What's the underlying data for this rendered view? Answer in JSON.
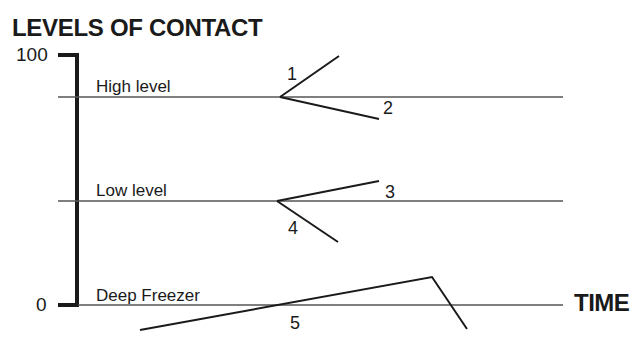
{
  "title": "LEVELS OF CONTACT",
  "axis": {
    "y_top_label": "100",
    "y_bottom_label": "0",
    "x_label": "TIME"
  },
  "levels": [
    {
      "label": "High level"
    },
    {
      "label": "Low level"
    },
    {
      "label": "Deep Freezer"
    }
  ],
  "paths": [
    {
      "id": "1",
      "description": "from high level rising upward"
    },
    {
      "id": "2",
      "description": "from high level declining slightly"
    },
    {
      "id": "3",
      "description": "from low level rising"
    },
    {
      "id": "4",
      "description": "from low level falling"
    },
    {
      "id": "5",
      "description": "rising through deep freezer then dropping sharply"
    }
  ],
  "colors": {
    "ink": "#1a1a1a",
    "thin_line": "#555555",
    "background": "#ffffff"
  }
}
